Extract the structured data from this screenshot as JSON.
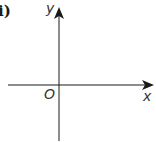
{
  "figure": {
    "part_label": "i)",
    "axes": {
      "x_label": "x",
      "y_label": "y",
      "origin_label": "O"
    },
    "colors": {
      "axis": "#1a1a1a",
      "background": "#ffffff"
    }
  }
}
